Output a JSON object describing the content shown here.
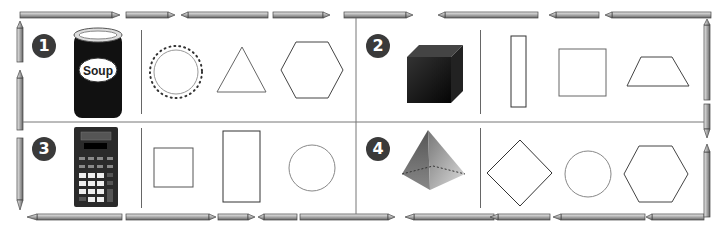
{
  "worksheet": {
    "problems": [
      {
        "number": "1",
        "object": "soup can",
        "object_label": "Soup",
        "choices": [
          "circle",
          "triangle",
          "hexagon"
        ],
        "marked_choice": "circle"
      },
      {
        "number": "2",
        "object": "cube",
        "choices": [
          "rectangle",
          "square",
          "trapezoid"
        ]
      },
      {
        "number": "3",
        "object": "calculator",
        "choices": [
          "square",
          "rectangle",
          "circle"
        ]
      },
      {
        "number": "4",
        "object": "pyramid",
        "choices": [
          "rhombus",
          "circle",
          "hexagon"
        ]
      }
    ]
  },
  "colors": {
    "badge": "#3a3a3a",
    "divider": "#555555",
    "shape_stroke": "#555555",
    "pencil_body": "#c8c8c8",
    "pencil_dark": "#555555"
  }
}
